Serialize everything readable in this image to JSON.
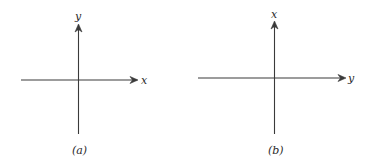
{
  "diagrams": [
    {
      "id": "a",
      "caption": "(a)",
      "horizontal_axis_label": "x",
      "vertical_axis_label": "y"
    },
    {
      "id": "b",
      "caption": "(b)",
      "horizontal_axis_label": "y",
      "vertical_axis_label": "x"
    }
  ],
  "colors": {
    "line": "#3a3a3a",
    "text": "#2a2a2a",
    "background": "#ffffff"
  }
}
